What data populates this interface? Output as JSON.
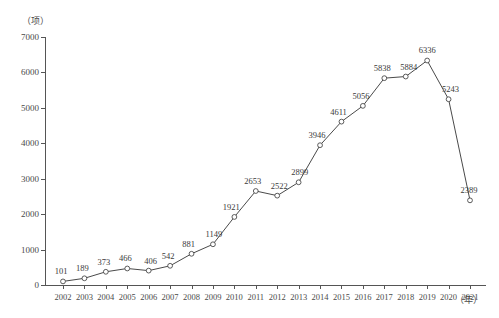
{
  "chart_data": {
    "type": "line",
    "title": "",
    "xlabel": "年",
    "ylabel": "项",
    "y_unit_label": "（项）",
    "x_unit_label": "（年）",
    "categories": [
      "2002",
      "2003",
      "2004",
      "2005",
      "2006",
      "2007",
      "2008",
      "2009",
      "2010",
      "2011",
      "2012",
      "2013",
      "2014",
      "2015",
      "2016",
      "2017",
      "2018",
      "2019",
      "2020",
      "2021"
    ],
    "values": [
      101,
      189,
      373,
      466,
      406,
      542,
      881,
      1149,
      1921,
      2653,
      2522,
      2899,
      3946,
      4611,
      5056,
      5838,
      5884,
      6336,
      5243,
      2389
    ],
    "point_labels": [
      "101",
      "189",
      "373",
      "466",
      "406",
      "542",
      "881",
      "1149",
      "1921",
      "2653",
      "2522",
      "2899",
      "3946",
      "4611",
      "5056",
      "5838",
      "5884",
      "6336",
      "5243",
      "2389"
    ],
    "ylim": [
      0,
      7000
    ],
    "y_ticks": [
      0,
      1000,
      2000,
      3000,
      4000,
      5000,
      6000,
      7000
    ],
    "y_tick_labels": [
      "0",
      "1000",
      "2000",
      "3000",
      "4000",
      "5000",
      "6000",
      "7000"
    ],
    "grid": false,
    "legend": "none",
    "marker": "open-circle",
    "line_color": "#4a4a4a",
    "marker_fill": "#ffffff",
    "axis_color": "#555555",
    "label_color": "#3a3a3a"
  }
}
